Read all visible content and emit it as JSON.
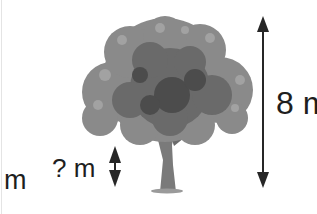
{
  "diagram": {
    "labels": {
      "left_partial": "m",
      "unknown_height": "? m",
      "tree_height": "8 m"
    },
    "arrows": [
      {
        "name": "tree-height-arrow",
        "orientation": "vertical",
        "double_headed": true,
        "label": "8 m"
      },
      {
        "name": "unknown-height-arrow",
        "orientation": "vertical",
        "double_headed": true,
        "label": "? m"
      }
    ],
    "colors": {
      "foliage": "#6e6e6e",
      "foliage_dark": "#4a4a4a",
      "foliage_light": "#9a9a9a",
      "trunk": "#7a7a7a",
      "arrow": "#262626",
      "text": "#1e1e1e"
    }
  }
}
